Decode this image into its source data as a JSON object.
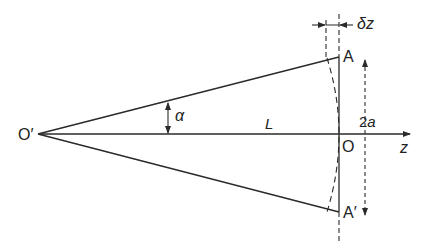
{
  "diagram": {
    "type": "geometric-optics-cone",
    "colors": {
      "line": "#2a2a2a",
      "background": "#ffffff",
      "text": "#222222"
    },
    "points": {
      "O_prime": {
        "label": "O′",
        "x": 38,
        "y": 134
      },
      "O": {
        "label": "O",
        "x": 339,
        "y": 134
      },
      "A": {
        "label": "A",
        "x": 339,
        "y": 57
      },
      "A_prime": {
        "label": "A′",
        "x": 339,
        "y": 212
      }
    },
    "labels": {
      "alpha": "α",
      "L": "L",
      "two_a": "2a",
      "z": "z",
      "delta_z": "δz"
    },
    "axis": {
      "name": "z",
      "from_x": 38,
      "to_x": 410,
      "y": 134
    }
  }
}
